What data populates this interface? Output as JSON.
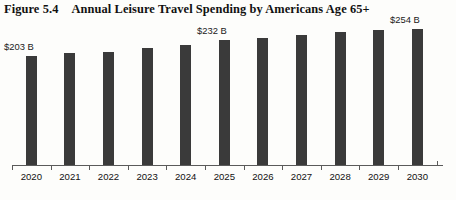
{
  "figure": {
    "number": "Figure 5.4",
    "title": "Annual Leisure Travel Spending by Americans Age 65+"
  },
  "chart_data": {
    "type": "bar",
    "title": "Annual Leisure Travel Spending by Americans Age 65+",
    "xlabel": "",
    "ylabel": "",
    "grid": false,
    "legend": false,
    "bar_color": "#3a3a3a",
    "axis_color": "#5a5a5a",
    "background_color": "#fdfdfb",
    "unit": "Billions of US dollars",
    "categories": [
      "2020",
      "2021",
      "2022",
      "2023",
      "2024",
      "2025",
      "2026",
      "2027",
      "2028",
      "2029",
      "2030"
    ],
    "values": [
      203,
      208,
      210,
      218,
      223,
      232,
      237,
      242,
      247,
      251,
      254
    ],
    "ylim": [
      0,
      270
    ],
    "data_labels": [
      {
        "category": "2020",
        "text": "$203 B"
      },
      {
        "category": "2025",
        "text": "$232 B"
      },
      {
        "category": "2030",
        "text": "$254 B"
      }
    ]
  }
}
